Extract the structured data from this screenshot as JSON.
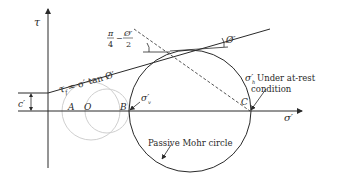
{
  "figure": {
    "axes": {
      "y_label": "τ",
      "x_label": "σ′"
    },
    "envelope_label": {
      "lhs": "τ",
      "lhs_sub": "f",
      "rhs": "= σ′ tan Ø′"
    },
    "cohesion_label": "c′",
    "angle_label": {
      "numerator_left": "π",
      "denominator_left": "4",
      "minus": "−",
      "numerator_right": "Ø′",
      "denominator_right": "2"
    },
    "friction_angle_label": "Ø′",
    "points": {
      "A": "A",
      "O": "O",
      "B": "B",
      "C": "C"
    },
    "sigma_v_label": {
      "main": "σ′",
      "sub": "v"
    },
    "sigma_h_label": {
      "main": "σ′",
      "sub": "h",
      "line1": "Under at-rest",
      "line2": "condition"
    },
    "circle_label": "Passive Mohr circle",
    "colors": {
      "ink": "#2a2a2a",
      "faint_circle": "#c8c8c8"
    }
  }
}
